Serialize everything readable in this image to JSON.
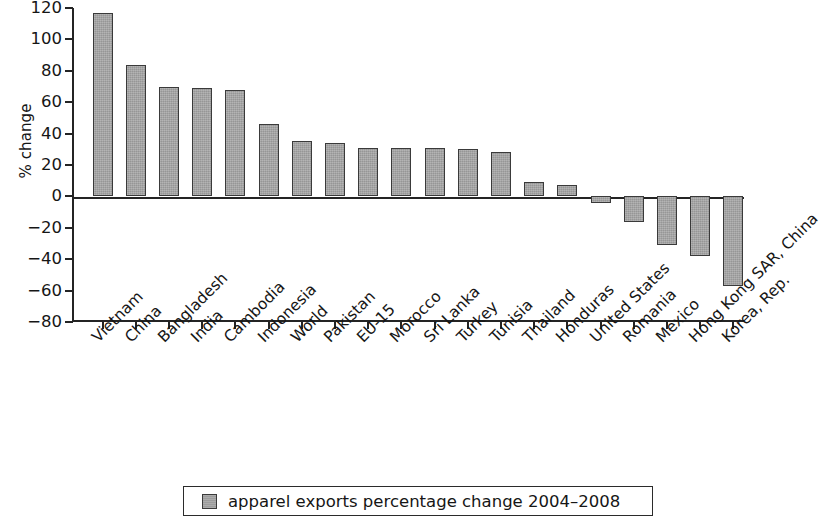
{
  "chart_data": {
    "type": "bar",
    "title": "",
    "subtitle": "",
    "xlabel": "",
    "ylabel": "% change",
    "ylim": [
      -80,
      120
    ],
    "ytick_step": 20,
    "grid": false,
    "legend_position": "bottom",
    "legend": [
      "apparel exports percentage change 2004–2008"
    ],
    "series_name": "apparel exports percentage change 2004–2008",
    "bar_color": "#a3a3a3",
    "bar_edge_color": "#3a3a3a",
    "yticks": [
      120,
      100,
      80,
      60,
      40,
      20,
      0,
      -20,
      -40,
      -60,
      -80
    ],
    "ytick_labels": [
      "120",
      "100",
      "80",
      "60",
      "40",
      "20",
      "0",
      "−20",
      "−40",
      "−60",
      "−80"
    ],
    "categories": [
      "Vietnam",
      "China",
      "Bangladesh",
      "India",
      "Cambodia",
      "Indonesia",
      "World",
      "Pakistan",
      "EU-15",
      "Morocco",
      "Sri Lanka",
      "Turkey",
      "Tunisia",
      "Thailand",
      "Honduras",
      "United States",
      "Romania",
      "Mexico",
      "Hong Kong SAR, China",
      "Korea, Rep."
    ],
    "values": [
      117,
      84,
      70,
      69,
      68,
      46,
      35,
      34,
      31,
      31,
      31,
      30,
      28,
      9,
      7,
      -4,
      -16,
      -31,
      -38,
      -57
    ]
  },
  "legend": {
    "label": "apparel exports percentage change 2004–2008",
    "swatch_name": "legend-color-swatch"
  },
  "axes": {
    "y_title": "% change"
  }
}
